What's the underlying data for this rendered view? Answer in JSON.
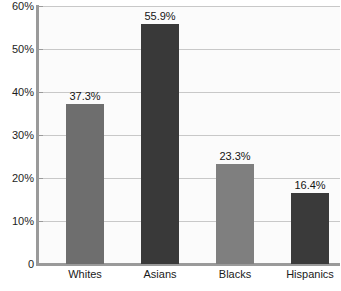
{
  "chart_data": {
    "type": "bar",
    "title": "",
    "subtitle": "",
    "xlabel": "",
    "ylabel": "",
    "categories": [
      "Whites",
      "Asians",
      "Blacks",
      "Hispanics"
    ],
    "values": [
      37.3,
      55.9,
      23.3,
      16.4
    ],
    "value_labels": [
      "37.3%",
      "55.9%",
      "23.3%",
      "16.4%"
    ],
    "bar_colors": [
      "#6e6e6e",
      "#393939",
      "#7f7f7f",
      "#3a3a3a"
    ],
    "ylim": [
      0,
      60
    ],
    "ytick_values": [
      0,
      10,
      20,
      30,
      40,
      50,
      60
    ],
    "ytick_labels": [
      "0",
      "10%",
      "20%",
      "30%",
      "40%",
      "50%",
      "60%"
    ],
    "grid": true,
    "grid_axis": "y",
    "grid_color": "#c8c8c8",
    "legend": false,
    "legend_position": "none",
    "plot_background": "#fbfbfb",
    "axis_color": "#9a9a9a",
    "text_color": "#1a1a1a"
  }
}
